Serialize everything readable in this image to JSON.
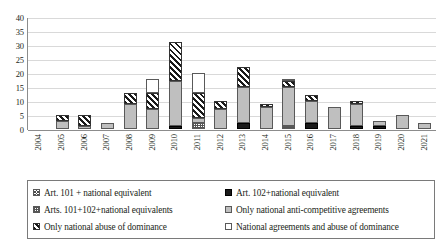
{
  "chart_data": {
    "type": "bar",
    "stacked": true,
    "title": "",
    "xlabel": "",
    "ylabel": "",
    "ylim": [
      0,
      40
    ],
    "ytick_step": 5,
    "grid": true,
    "legend_position": "bottom",
    "categories": [
      "2004",
      "2005",
      "2006",
      "2007",
      "2008",
      "2009",
      "2010",
      "2011",
      "2012",
      "2013",
      "2014",
      "2015",
      "2016",
      "2017",
      "2018",
      "2019",
      "2020",
      "2021"
    ],
    "ytick_labels": [
      "40",
      "35",
      "30",
      "25",
      "20",
      "15",
      "10",
      "5",
      "0"
    ],
    "series": [
      {
        "name": "Art. 101 + national equivalent",
        "pattern": "cross-hatch",
        "values": [
          0,
          0,
          0,
          0,
          0,
          0,
          0,
          0,
          0,
          0,
          0,
          0,
          0,
          0,
          0,
          0,
          0,
          0
        ]
      },
      {
        "name": "Art. 102+national equivalent",
        "pattern": "solid-black",
        "values": [
          0,
          0,
          0,
          0,
          0,
          0,
          1,
          0,
          0,
          2,
          0,
          0,
          2,
          0,
          1,
          1,
          0,
          0
        ]
      },
      {
        "name": "Arts. 101+102+national equivalents",
        "pattern": "fine-dots",
        "values": [
          0,
          0,
          0,
          0,
          0,
          0,
          0,
          2,
          0,
          0,
          0,
          1,
          0,
          0,
          0,
          0,
          0,
          0
        ]
      },
      {
        "name": "Only national anti-competitive agreements",
        "pattern": "solid-gray",
        "values": [
          0,
          3,
          1,
          2,
          9,
          7,
          16,
          2,
          7,
          13,
          8,
          14,
          8,
          8,
          8,
          2,
          5,
          2
        ]
      },
      {
        "name": "Only national abuse of dominance",
        "pattern": "diagonal-stripes",
        "values": [
          0,
          2,
          4,
          0,
          4,
          6,
          14,
          9,
          3,
          7,
          1,
          2,
          2,
          0,
          1,
          0,
          0,
          0
        ]
      },
      {
        "name": "National agreements and abuse of dominance",
        "pattern": "white-outline",
        "values": [
          0,
          0,
          0,
          0,
          0,
          5,
          0,
          7,
          0,
          0,
          0,
          1,
          0,
          0,
          0,
          0,
          0,
          0
        ]
      }
    ],
    "totals": [
      0,
      5,
      5,
      2,
      13,
      18,
      31,
      20,
      10,
      22,
      9,
      18,
      12,
      8,
      10,
      3,
      5,
      2
    ]
  },
  "legend": {
    "items": [
      {
        "label": "Art. 101 + national equivalent",
        "pattern": "cross-hatch"
      },
      {
        "label": "Art. 102+national equivalent",
        "pattern": "solid-black"
      },
      {
        "label": "Arts. 101+102+national equivalents",
        "pattern": "fine-dots"
      },
      {
        "label": "Only national anti-competitive agreements",
        "pattern": "solid-gray"
      },
      {
        "label": "Only national abuse of dominance",
        "pattern": "diagonal-stripes"
      },
      {
        "label": "National agreements and abuse of dominance",
        "pattern": "white-outline"
      }
    ]
  },
  "colors": {
    "gray_fill": "#bfbfbf",
    "black_fill": "#1a1a1a",
    "white_fill": "#ffffff",
    "gridline": "#d9d9d9",
    "axis": "#8c8c8c",
    "text": "#231f20"
  }
}
